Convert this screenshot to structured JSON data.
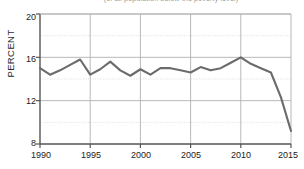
{
  "chart_data": {
    "type": "line",
    "title": "(of all population below the poverty level)",
    "xlabel": "",
    "ylabel": "PERCENT",
    "xlim": [
      1990,
      2015
    ],
    "ylim": [
      8,
      20
    ],
    "yticks": [
      8,
      12,
      16,
      20
    ],
    "yticks_minor": [
      10,
      14,
      18
    ],
    "xticks": [
      1990,
      1995,
      2000,
      2005,
      2010,
      2015
    ],
    "grid": true,
    "legend": false,
    "line_color": "#6b6b6b",
    "x": [
      1990,
      1991,
      1992,
      1993,
      1994,
      1995,
      1996,
      1997,
      1998,
      1999,
      2000,
      2001,
      2002,
      2003,
      2004,
      2005,
      2006,
      2007,
      2008,
      2009,
      2010,
      2011,
      2012,
      2013,
      2014,
      2015
    ],
    "values": [
      15.0,
      14.4,
      14.8,
      15.3,
      15.8,
      14.4,
      14.9,
      15.6,
      14.8,
      14.3,
      14.9,
      14.4,
      15.0,
      15.0,
      14.8,
      14.6,
      15.1,
      14.8,
      15.0,
      15.5,
      16.0,
      15.4,
      15.0,
      14.6,
      12.3,
      9.2
    ],
    "series": [
      {
        "name": "Percent",
        "values": [
          15.0,
          14.4,
          14.8,
          15.3,
          15.8,
          14.4,
          14.9,
          15.6,
          14.8,
          14.3,
          14.9,
          14.4,
          15.0,
          15.0,
          14.8,
          14.6,
          15.1,
          14.8,
          15.0,
          15.5,
          16.0,
          15.4,
          15.0,
          14.6,
          12.3,
          9.2
        ]
      }
    ]
  },
  "axis": {
    "ylabel": "PERCENT",
    "ytick_labels": [
      "20",
      "16",
      "12",
      "8"
    ],
    "xtick_labels": [
      "1990",
      "1995",
      "2000",
      "2005",
      "2010",
      "2015"
    ]
  },
  "colors": {
    "line": "#6b6b6b",
    "grid_major": "#b0b0b0",
    "grid_minor": "#d8d8d8",
    "axis": "#555555",
    "text": "#222222"
  }
}
